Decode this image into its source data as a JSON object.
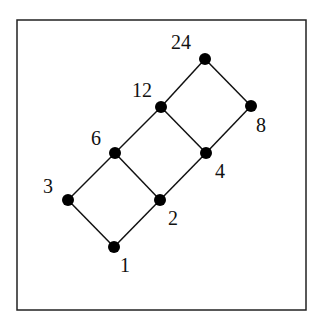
{
  "diagram": {
    "type": "hasse",
    "frame": {
      "x": 17,
      "y": 20,
      "width": 289,
      "height": 290
    },
    "nodes": [
      {
        "id": "24",
        "label": "24",
        "x": 205,
        "y": 59,
        "lx": 171,
        "ly": 49
      },
      {
        "id": "12",
        "label": "12",
        "x": 161,
        "y": 107,
        "lx": 132,
        "ly": 97
      },
      {
        "id": "8",
        "label": "8",
        "x": 251,
        "y": 106,
        "lx": 256,
        "ly": 132
      },
      {
        "id": "6",
        "label": "6",
        "x": 115,
        "y": 153,
        "lx": 91,
        "ly": 145
      },
      {
        "id": "4",
        "label": "4",
        "x": 206,
        "y": 153,
        "lx": 215,
        "ly": 178
      },
      {
        "id": "3",
        "label": "3",
        "x": 68,
        "y": 200,
        "lx": 43,
        "ly": 193
      },
      {
        "id": "2",
        "label": "2",
        "x": 160,
        "y": 200,
        "lx": 168,
        "ly": 225
      },
      {
        "id": "1",
        "label": "1",
        "x": 114,
        "y": 247,
        "lx": 120,
        "ly": 272
      }
    ],
    "edges": [
      [
        "1",
        "3"
      ],
      [
        "1",
        "2"
      ],
      [
        "3",
        "6"
      ],
      [
        "2",
        "6"
      ],
      [
        "2",
        "4"
      ],
      [
        "6",
        "12"
      ],
      [
        "4",
        "12"
      ],
      [
        "4",
        "8"
      ],
      [
        "12",
        "24"
      ],
      [
        "8",
        "24"
      ]
    ]
  }
}
